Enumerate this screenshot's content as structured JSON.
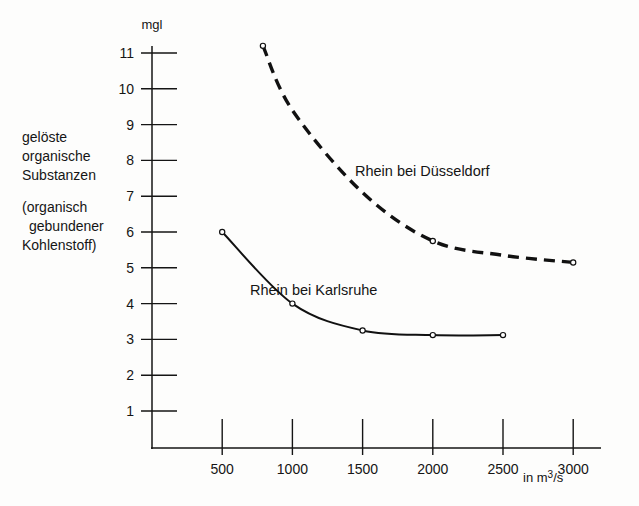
{
  "axis": {
    "y_unit": "mgl",
    "x_unit": "in m3/s",
    "x_unit_base": "in m",
    "x_unit_sup": "3",
    "x_unit_tail": "/s",
    "y_ticks": [
      "1",
      "2",
      "3",
      "4",
      "5",
      "6",
      "7",
      "8",
      "9",
      "10",
      "11"
    ],
    "x_ticks": [
      "500",
      "1000",
      "1500",
      "2000",
      "2500",
      "3000"
    ]
  },
  "ylabel": {
    "line1": "gelöste",
    "line2": "organische",
    "line3": "Substanzen",
    "line4": "(organisch",
    "line5": "gebundener",
    "line6": "Kohlenstoff)"
  },
  "annotations": {
    "duesseldorf": "Rhein bei Düsseldorf",
    "karlsruhe": "Rhein bei Karlsruhe"
  },
  "colors": {
    "ink": "#151515",
    "line": "#111111",
    "paper": "#fdfdfc"
  },
  "chart_data": {
    "type": "line",
    "title": "",
    "xlabel": "in m3/s",
    "ylabel": "gelöste organische Substanzen (organisch gebundener Kohlenstoff)",
    "y_unit": "mgl",
    "xlim": [
      0,
      3150
    ],
    "ylim": [
      0,
      11.6
    ],
    "grid": false,
    "legend": "inline-annotations",
    "series": [
      {
        "name": "Rhein bei Düsseldorf",
        "style": "dashed",
        "markers": [
          true,
          false,
          false,
          true,
          false,
          true
        ],
        "x": [
          790,
          1000,
          1500,
          2000,
          2500,
          3000
        ],
        "y": [
          11.2,
          9.4,
          7.1,
          5.75,
          5.35,
          5.15
        ]
      },
      {
        "name": "Rhein bei Karlsruhe",
        "style": "solid",
        "markers": [
          true,
          true,
          true,
          true,
          true
        ],
        "x": [
          500,
          1000,
          1500,
          2000,
          2500
        ],
        "y": [
          6.0,
          4.0,
          3.25,
          3.12,
          3.12
        ]
      }
    ]
  }
}
